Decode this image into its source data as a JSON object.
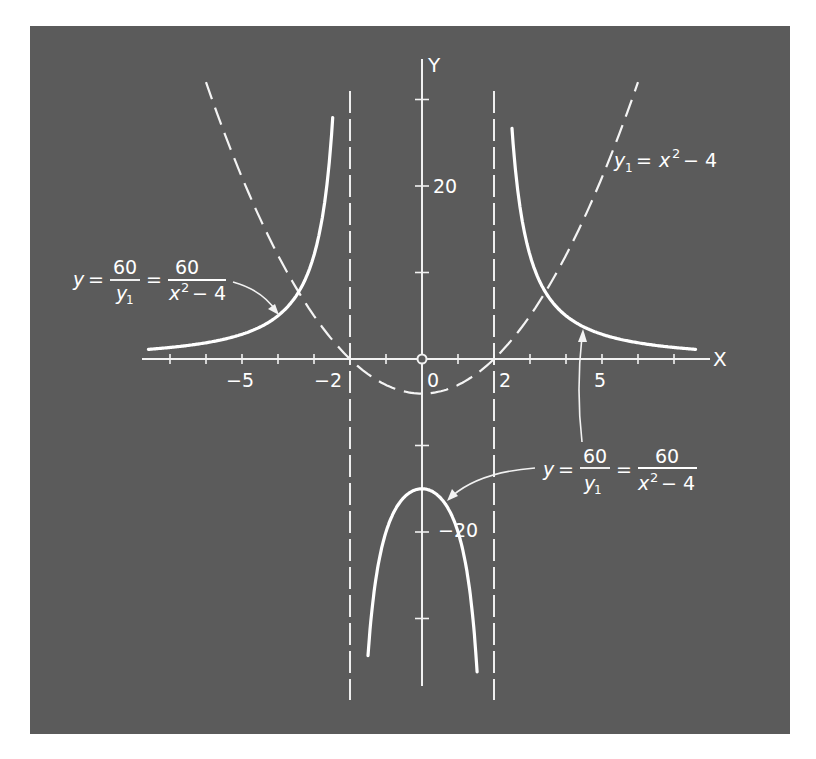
{
  "chart_data": {
    "type": "line",
    "title": "",
    "xlabel": "X",
    "ylabel": "Y",
    "xlim": [
      -7.6,
      7.8
    ],
    "ylim": [
      -38,
      35
    ],
    "grid": false,
    "legend": "none (inline annotations)",
    "x_ticks": [
      -7,
      -6,
      -5,
      -4,
      -3,
      -2,
      -1,
      1,
      2,
      3,
      4,
      5,
      6,
      7
    ],
    "x_tick_labels": {
      "-5": "−5",
      "-2": "−2",
      "0": "0",
      "2": "2",
      "5": "5"
    },
    "y_ticks": [
      -30,
      -20,
      -10,
      10,
      20,
      30
    ],
    "y_tick_labels": {
      "20": "20",
      "-20": "−20"
    },
    "asymptotes": [
      {
        "x": -2,
        "style": "dashed"
      },
      {
        "x": 2,
        "style": "dashed"
      }
    ],
    "series": [
      {
        "name": "y1 = x^2 - 4",
        "style": "dashed",
        "formula": "x^2-4",
        "x_range": [
          -6,
          6
        ],
        "points": [
          [
            -6,
            32
          ],
          [
            -5,
            21
          ],
          [
            -4,
            12
          ],
          [
            -3,
            5
          ],
          [
            -2,
            0
          ],
          [
            -1,
            -3
          ],
          [
            0,
            -4
          ],
          [
            1,
            -3
          ],
          [
            2,
            0
          ],
          [
            3,
            5
          ],
          [
            4,
            12
          ],
          [
            5,
            21
          ],
          [
            6,
            32
          ]
        ]
      },
      {
        "name": "y = 60/y1 = 60/(x^2-4) (outer left branch)",
        "style": "solid",
        "formula": "60/(x^2-4)",
        "x_range": [
          -7.6,
          -2.48
        ],
        "points": [
          [
            -7.6,
            1.1
          ],
          [
            -7,
            1.33
          ],
          [
            -6,
            1.88
          ],
          [
            -5,
            2.86
          ],
          [
            -4,
            5
          ],
          [
            -3,
            12
          ],
          [
            -2.5,
            26.7
          ]
        ]
      },
      {
        "name": "y = 60/y1 = 60/(x^2-4) (outer right branch)",
        "style": "solid",
        "formula": "60/(x^2-4)",
        "x_range": [
          2.5,
          7.6
        ],
        "points": [
          [
            2.5,
            26.7
          ],
          [
            3,
            12
          ],
          [
            4,
            5
          ],
          [
            5,
            2.86
          ],
          [
            6,
            1.88
          ],
          [
            7,
            1.33
          ],
          [
            7.6,
            1.1
          ]
        ]
      },
      {
        "name": "y = 60/y1 = 60/(x^2-4) (inner branch)",
        "style": "solid",
        "formula": "60/(x^2-4)",
        "x_range": [
          -1.5,
          1.53
        ],
        "points": [
          [
            -1.5,
            -34.3
          ],
          [
            -1.25,
            -24.6
          ],
          [
            -1,
            -20
          ],
          [
            -0.5,
            -16
          ],
          [
            0,
            -15
          ],
          [
            0.5,
            -16
          ],
          [
            1,
            -20
          ],
          [
            1.25,
            -24.6
          ],
          [
            1.5,
            -34.3
          ]
        ]
      }
    ],
    "annotations": [
      {
        "text": "y = 60/y₁ = 60/(x²−4)",
        "points_to": "outer left branch"
      },
      {
        "text": "y₁ = x² − 4",
        "points_to": "dashed parabola"
      },
      {
        "text": "y = 60/y₁ = 60/(x²−4)",
        "points_to": "outer right branch and inner branch"
      }
    ]
  },
  "axes": {
    "x_label": "X",
    "y_label": "Y",
    "x_tick_labels": {
      "neg5": "−5",
      "neg2": "−2",
      "zero": "0",
      "pos2": "2",
      "pos5": "5"
    },
    "y_tick_labels": {
      "pos20": "20",
      "neg20": "−20"
    }
  },
  "annotations": {
    "left": {
      "lhs": "y",
      "eq": "=",
      "num1": "60",
      "den1_var": "y",
      "den1_sub": "1",
      "eq2": "=",
      "num2": "60",
      "den2_var": "x",
      "den2_sup": "2",
      "den2_rest": "− 4"
    },
    "parabola": {
      "var": "y",
      "sub": "1",
      "eq": "=",
      "rhs_var": "x",
      "rhs_sup": "2",
      "rhs_rest": "− 4"
    },
    "lower": {
      "lhs": "y",
      "eq": "=",
      "num1": "60",
      "den1_var": "y",
      "den1_sub": "1",
      "eq2": "=",
      "num2": "60",
      "den2_var": "x",
      "den2_sup": "2",
      "den2_rest": "− 4"
    }
  },
  "colors": {
    "panel": "#5b5b5b",
    "lines": "#ffffff"
  }
}
